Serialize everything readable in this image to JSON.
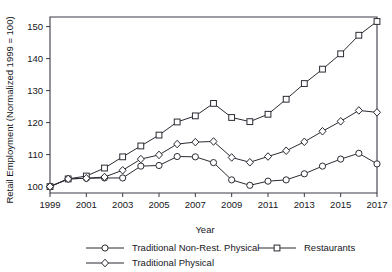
{
  "chart_data": {
    "type": "line",
    "title": "",
    "xlabel": "Year",
    "ylabel": "Retail Employment (Normalized 1999 = 100)",
    "xlim": [
      1999,
      2017
    ],
    "ylim": [
      98,
      153
    ],
    "grid": false,
    "legend_position": "bottom",
    "x": [
      1999,
      2000,
      2001,
      2002,
      2003,
      2004,
      2005,
      2006,
      2007,
      2008,
      2009,
      2010,
      2011,
      2012,
      2013,
      2014,
      2015,
      2016,
      2017
    ],
    "xticks": [
      "1999",
      "2001",
      "2003",
      "2005",
      "2007",
      "2009",
      "2011",
      "2013",
      "2015",
      "2017"
    ],
    "xtick_values": [
      1999,
      2001,
      2003,
      2005,
      2007,
      2009,
      2011,
      2013,
      2015,
      2017
    ],
    "yticks": [
      "100",
      "110",
      "120",
      "130",
      "140",
      "150"
    ],
    "ytick_values": [
      100,
      110,
      120,
      130,
      140,
      150
    ],
    "series": [
      {
        "name": "Traditional Non-Rest. Physical",
        "marker": "circle",
        "values": [
          100.0,
          102.4,
          102.6,
          102.7,
          102.7,
          106.4,
          106.6,
          109.4,
          109.3,
          107.5,
          102.1,
          100.4,
          101.7,
          102.1,
          104.0,
          106.4,
          108.6,
          110.4,
          107.1
        ]
      },
      {
        "name": "Restaurants",
        "marker": "square",
        "values": [
          100.0,
          102.4,
          103.3,
          105.8,
          109.3,
          112.7,
          116.1,
          120.2,
          122.1,
          126.0,
          121.6,
          120.3,
          122.6,
          127.3,
          132.2,
          136.7,
          141.5,
          147.3,
          151.6
        ]
      },
      {
        "name": "Traditional Physical",
        "marker": "diamond",
        "values": [
          100.0,
          102.4,
          102.6,
          103.0,
          105.1,
          108.6,
          109.9,
          113.3,
          113.9,
          114.1,
          109.1,
          107.6,
          109.4,
          111.2,
          114.0,
          117.3,
          120.4,
          123.8,
          123.2
        ]
      }
    ]
  },
  "legend": {
    "entries": [
      {
        "label": "Traditional Non-Rest. Physical",
        "marker": "circle-marker"
      },
      {
        "label": "Restaurants",
        "marker": "square-marker"
      },
      {
        "label": "Traditional Physical",
        "marker": "diamond-marker"
      }
    ]
  },
  "colors": {
    "line": "#2b2b33",
    "marker_fill": "#ffffff",
    "axis": "#3b3b46",
    "text": "#17171c",
    "background": "#ffffff"
  }
}
